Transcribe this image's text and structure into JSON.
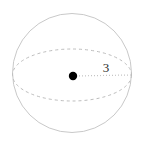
{
  "figure": {
    "name": "sphere-with-radius",
    "background_color": "#ffffff",
    "width": 143,
    "height": 141,
    "outline_color": "#c9c9c9",
    "equator_color": "#bdbdbd",
    "radius_line_color": "#c4c4c4",
    "center_dot_color": "#000000",
    "label_color": "#2b2b2b",
    "sphere": {
      "center_x": 72,
      "center_y": 73,
      "radius": 59.5
    },
    "equator_ellipse": {
      "center_x": 72,
      "center_y": 75,
      "radius_x": 59.5,
      "radius_y": 26,
      "dash_pattern": "3 3"
    },
    "center_dot": {
      "x": 73,
      "y": 76,
      "radius": 4.2
    },
    "radius_segment": {
      "x1": 73,
      "y1": 76,
      "x2": 131,
      "y2": 75,
      "dash_pattern": "1 2"
    },
    "radius_label": {
      "text": "3",
      "x": 106,
      "y": 72
    }
  }
}
